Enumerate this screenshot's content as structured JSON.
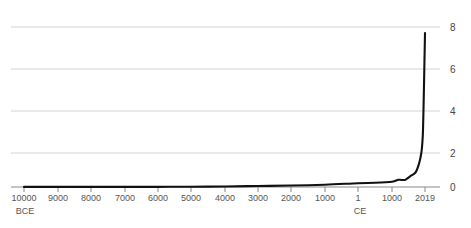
{
  "chart_data": {
    "type": "line",
    "title": "",
    "subtitle": "",
    "xlabel": "",
    "ylabel": "",
    "grid": true,
    "legend_position": "none",
    "ylim": [
      0,
      8
    ],
    "y_ticks": [
      0,
      2,
      4,
      6,
      8
    ],
    "x_tick_labels": [
      "10000",
      "9000",
      "8000",
      "7000",
      "6000",
      "5000",
      "4000",
      "3000",
      "2000",
      "1000",
      "1",
      "1000",
      "2019"
    ],
    "era_labels": [
      {
        "text": "BCE",
        "at_tick": "10000"
      },
      {
        "text": "CE",
        "at_tick": "1"
      }
    ],
    "x": [
      -10000,
      -9000,
      -8000,
      -7000,
      -6000,
      -5000,
      -4000,
      -3000,
      -2000,
      -1000,
      1,
      500,
      1000,
      1200,
      1400,
      1500,
      1600,
      1700,
      1750,
      1800,
      1850,
      1900,
      1927,
      1950,
      1960,
      1974,
      1987,
      1999,
      2011,
      2019
    ],
    "values": [
      0.004,
      0.005,
      0.005,
      0.006,
      0.007,
      0.015,
      0.028,
      0.05,
      0.072,
      0.115,
      0.19,
      0.21,
      0.265,
      0.36,
      0.35,
      0.46,
      0.58,
      0.68,
      0.79,
      0.99,
      1.26,
      1.65,
      2.0,
      2.54,
      3.03,
      4.0,
      5.0,
      6.0,
      7.0,
      7.7
    ],
    "series_name": "World population (billions)",
    "line_color": "#111111",
    "grid_color": "#d4d4d4",
    "axis_color": "#888888",
    "peak_value": 7.7
  }
}
